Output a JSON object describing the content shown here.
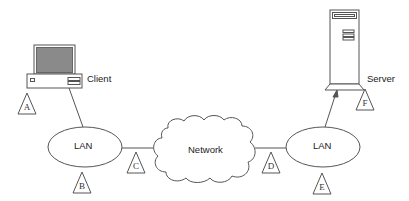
{
  "diagram": {
    "nodes": {
      "client": {
        "label": "Client"
      },
      "server": {
        "label": "Server"
      },
      "lan_left": {
        "label": "LAN"
      },
      "lan_right": {
        "label": "LAN"
      },
      "network": {
        "label": "Network"
      }
    },
    "markers": [
      {
        "id": "A",
        "label": "A"
      },
      {
        "id": "B",
        "label": "B"
      },
      {
        "id": "C",
        "label": "C"
      },
      {
        "id": "D",
        "label": "D"
      },
      {
        "id": "E",
        "label": "E"
      },
      {
        "id": "F",
        "label": "F"
      }
    ],
    "connections": [
      {
        "from": "client",
        "to": "lan_left"
      },
      {
        "from": "lan_left",
        "to": "network"
      },
      {
        "from": "network",
        "to": "lan_right"
      },
      {
        "from": "lan_right",
        "to": "server"
      }
    ],
    "colors": {
      "stroke": "#555555",
      "screen": "#8a8a8a",
      "background": "#ffffff"
    }
  }
}
